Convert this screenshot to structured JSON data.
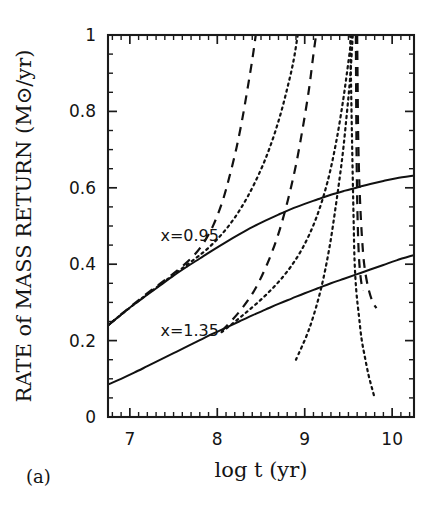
{
  "figure": {
    "panel_label": "(a)",
    "background_color": "#ffffff",
    "ink_color": "#111111"
  },
  "annotations": [
    {
      "name": "label-x-095",
      "text": "x=0.95",
      "x": 7.35,
      "y": 0.475
    },
    {
      "name": "label-x-135",
      "text": "x=1.35",
      "x": 7.35,
      "y": 0.225
    }
  ],
  "chart_data": {
    "type": "line",
    "title": "",
    "subtitle": "",
    "xlabel": "log t (yr)",
    "ylabel": "RATE of MASS RETURN (M⊙/yr)",
    "xlim": [
      6.75,
      10.25
    ],
    "ylim": [
      0,
      1
    ],
    "grid": false,
    "legend": null,
    "legend_position": "none",
    "xticks": [
      7,
      8,
      9,
      10
    ],
    "xticklabels": [
      "7",
      "8",
      "9",
      "10"
    ],
    "xticks_minor": [
      6.8,
      6.9,
      7.1,
      7.2,
      7.3,
      7.4,
      7.5,
      7.6,
      7.7,
      7.8,
      7.9,
      8.1,
      8.2,
      8.3,
      8.4,
      8.5,
      8.6,
      8.7,
      8.8,
      8.9,
      9.1,
      9.2,
      9.3,
      9.4,
      9.5,
      9.6,
      9.7,
      9.8,
      9.9,
      10.1,
      10.2
    ],
    "yticks": [
      0,
      0.2,
      0.4,
      0.6,
      0.8,
      1
    ],
    "yticklabels": [
      "0",
      "0.2",
      "0.4",
      "0.6",
      "0.8",
      "1"
    ],
    "yticks_minor": [
      0.05,
      0.1,
      0.15,
      0.25,
      0.3,
      0.35,
      0.45,
      0.5,
      0.55,
      0.65,
      0.7,
      0.75,
      0.85,
      0.9,
      0.95
    ],
    "ticks_direction": "in",
    "series": [
      {
        "name": "x=0.95 solid",
        "style": "solid",
        "points": [
          [
            6.75,
            0.24
          ],
          [
            6.9,
            0.268
          ],
          [
            7.05,
            0.295
          ],
          [
            7.2,
            0.32
          ],
          [
            7.35,
            0.345
          ],
          [
            7.5,
            0.37
          ],
          [
            7.65,
            0.393
          ],
          [
            7.8,
            0.415
          ],
          [
            7.95,
            0.437
          ],
          [
            8.1,
            0.458
          ],
          [
            8.25,
            0.478
          ],
          [
            8.4,
            0.497
          ],
          [
            8.55,
            0.514
          ],
          [
            8.7,
            0.53
          ],
          [
            8.85,
            0.545
          ],
          [
            9.0,
            0.558
          ],
          [
            9.15,
            0.57
          ],
          [
            9.3,
            0.582
          ],
          [
            9.45,
            0.592
          ],
          [
            9.6,
            0.601
          ],
          [
            9.75,
            0.61
          ],
          [
            9.9,
            0.618
          ],
          [
            10.05,
            0.625
          ],
          [
            10.25,
            0.632
          ]
        ]
      },
      {
        "name": "x=1.35 solid",
        "style": "solid",
        "points": [
          [
            6.75,
            0.085
          ],
          [
            6.9,
            0.1
          ],
          [
            7.05,
            0.116
          ],
          [
            7.2,
            0.133
          ],
          [
            7.35,
            0.15
          ],
          [
            7.5,
            0.167
          ],
          [
            7.65,
            0.184
          ],
          [
            7.8,
            0.201
          ],
          [
            7.95,
            0.218
          ],
          [
            8.1,
            0.234
          ],
          [
            8.25,
            0.25
          ],
          [
            8.4,
            0.266
          ],
          [
            8.55,
            0.281
          ],
          [
            8.7,
            0.296
          ],
          [
            8.85,
            0.31
          ],
          [
            9.0,
            0.324
          ],
          [
            9.15,
            0.337
          ],
          [
            9.3,
            0.35
          ],
          [
            9.45,
            0.362
          ],
          [
            9.6,
            0.374
          ],
          [
            9.75,
            0.386
          ],
          [
            9.9,
            0.398
          ],
          [
            10.05,
            0.41
          ],
          [
            10.25,
            0.424
          ]
        ]
      },
      {
        "name": "x=0.95 dotted inner",
        "style": "dotted",
        "points": [
          [
            6.75,
            0.24
          ],
          [
            6.95,
            0.277
          ],
          [
            7.15,
            0.313
          ],
          [
            7.35,
            0.347
          ],
          [
            7.55,
            0.381
          ],
          [
            7.75,
            0.415
          ],
          [
            7.9,
            0.443
          ],
          [
            8.05,
            0.478
          ],
          [
            8.2,
            0.522
          ],
          [
            8.35,
            0.578
          ],
          [
            8.5,
            0.648
          ],
          [
            8.62,
            0.718
          ],
          [
            8.72,
            0.79
          ],
          [
            8.8,
            0.86
          ],
          [
            8.87,
            0.93
          ],
          [
            8.92,
            1.0
          ]
        ]
      },
      {
        "name": "x=0.95 dashed inner",
        "style": "dashed",
        "points": [
          [
            6.75,
            0.24
          ],
          [
            6.95,
            0.278
          ],
          [
            7.15,
            0.315
          ],
          [
            7.35,
            0.35
          ],
          [
            7.55,
            0.385
          ],
          [
            7.72,
            0.42
          ],
          [
            7.85,
            0.458
          ],
          [
            7.96,
            0.505
          ],
          [
            8.06,
            0.565
          ],
          [
            8.14,
            0.63
          ],
          [
            8.22,
            0.705
          ],
          [
            8.29,
            0.785
          ],
          [
            8.35,
            0.865
          ],
          [
            8.4,
            0.935
          ],
          [
            8.44,
            1.0
          ]
        ]
      },
      {
        "name": "x=0.95 dotted outer",
        "style": "dotted",
        "points": [
          [
            8.9,
            0.15
          ],
          [
            9.05,
            0.23
          ],
          [
            9.18,
            0.33
          ],
          [
            9.28,
            0.44
          ],
          [
            9.36,
            0.56
          ],
          [
            9.43,
            0.68
          ],
          [
            9.48,
            0.79
          ],
          [
            9.52,
            0.89
          ],
          [
            9.55,
            1.0
          ]
        ]
      },
      {
        "name": "x=1.35 dashed mid",
        "style": "dashed",
        "points": [
          [
            8.05,
            0.225
          ],
          [
            8.25,
            0.275
          ],
          [
            8.42,
            0.33
          ],
          [
            8.57,
            0.4
          ],
          [
            8.7,
            0.48
          ],
          [
            8.81,
            0.57
          ],
          [
            8.9,
            0.66
          ],
          [
            8.98,
            0.76
          ],
          [
            9.05,
            0.86
          ],
          [
            9.1,
            0.95
          ],
          [
            9.13,
            1.0
          ]
        ]
      },
      {
        "name": "x=1.35 dotted mid",
        "style": "dotted",
        "points": [
          [
            8.05,
            0.222
          ],
          [
            8.3,
            0.268
          ],
          [
            8.55,
            0.318
          ],
          [
            8.78,
            0.375
          ],
          [
            8.97,
            0.44
          ],
          [
            9.13,
            0.52
          ],
          [
            9.26,
            0.615
          ],
          [
            9.36,
            0.72
          ],
          [
            9.44,
            0.83
          ],
          [
            9.5,
            0.93
          ],
          [
            9.54,
            1.0
          ]
        ]
      },
      {
        "name": "x=1.35 dotted descending",
        "style": "dotted",
        "points": [
          [
            9.52,
            1.0
          ],
          [
            9.53,
            0.87
          ],
          [
            9.54,
            0.74
          ],
          [
            9.55,
            0.62
          ],
          [
            9.56,
            0.51
          ],
          [
            9.57,
            0.41
          ],
          [
            9.59,
            0.33
          ],
          [
            9.62,
            0.265
          ],
          [
            9.65,
            0.205
          ],
          [
            9.69,
            0.155
          ],
          [
            9.73,
            0.11
          ],
          [
            9.77,
            0.075
          ],
          [
            9.8,
            0.05
          ]
        ]
      },
      {
        "name": "x=0.95 dashed descending",
        "style": "dashed",
        "points": [
          [
            9.6,
            1.0
          ],
          [
            9.605,
            0.88
          ],
          [
            9.61,
            0.76
          ],
          [
            9.62,
            0.65
          ],
          [
            9.635,
            0.555
          ],
          [
            9.655,
            0.47
          ],
          [
            9.68,
            0.4
          ],
          [
            9.72,
            0.345
          ],
          [
            9.77,
            0.305
          ],
          [
            9.82,
            0.285
          ]
        ]
      },
      {
        "name": "x=0.95 dashed descending inner",
        "style": "dashed",
        "points": [
          [
            9.585,
            1.0
          ],
          [
            9.588,
            0.86
          ],
          [
            9.592,
            0.72
          ],
          [
            9.598,
            0.6
          ],
          [
            9.607,
            0.5
          ],
          [
            9.62,
            0.42
          ],
          [
            9.64,
            0.365
          ],
          [
            9.665,
            0.33
          ]
        ]
      }
    ]
  }
}
